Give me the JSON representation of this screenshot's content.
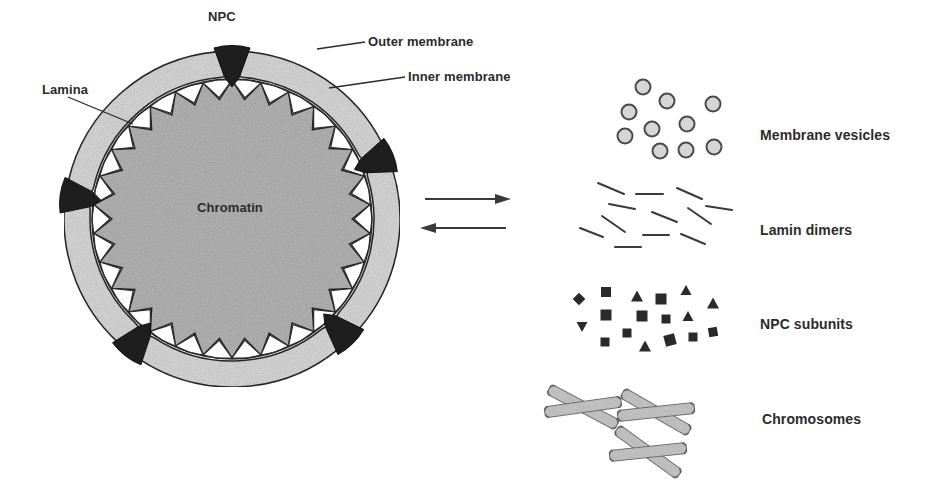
{
  "figure": {
    "nucleus": {
      "labels": {
        "npc": "NPC",
        "outer_membrane": "Outer membrane",
        "inner_membrane": "Inner membrane",
        "lamina": "Lamina",
        "chromatin": "Chromatin"
      }
    },
    "transition": {
      "forward_arrow": "right-arrow",
      "reverse_arrow": "left-arrow"
    },
    "components": [
      {
        "label": "Membrane vesicles",
        "icon": "vesicle-circles"
      },
      {
        "label": "Lamin dimers",
        "icon": "short-line-segments"
      },
      {
        "label": "NPC subunits",
        "icon": "black-squares-triangles"
      },
      {
        "label": "Chromosomes",
        "icon": "x-shaped-chromosomes"
      }
    ]
  },
  "colors": {
    "ink": "#2b2b2b",
    "chromatin_fill": "#b9b9b9",
    "membrane_fill": "#dedede",
    "npc_fill": "#1e1e1e",
    "background": "#ffffff"
  }
}
